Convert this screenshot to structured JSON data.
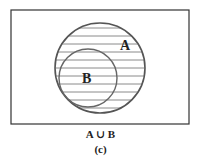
{
  "figure": {
    "universe_rect": {
      "x": 11,
      "y": 10,
      "w": 178,
      "h": 114
    },
    "set_a": {
      "label": "A",
      "cx": 100,
      "cy": 68,
      "r": 45,
      "label_x": 124,
      "label_y": 50
    },
    "set_b": {
      "label": "B",
      "cx": 88,
      "cy": 78,
      "r": 29,
      "label_x": 87,
      "label_y": 82
    },
    "shaded_region": "A ∪ B",
    "hatch": {
      "style": "horizontal",
      "spacing": 8
    },
    "colors": {
      "stroke": "#555555",
      "hatch": "#888888",
      "frame": "#333333",
      "text": "#222222"
    }
  },
  "caption": {
    "expression": "A ∪ B",
    "sublabel": "(c)"
  }
}
